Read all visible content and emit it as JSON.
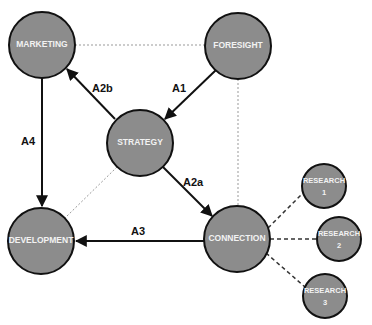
{
  "diagram": {
    "nodes": {
      "marketing": {
        "label": "MARKETING",
        "cx": 42,
        "cy": 45,
        "r": 33
      },
      "foresight": {
        "label": "FORESIGHT",
        "cx": 238,
        "cy": 46,
        "r": 33
      },
      "strategy": {
        "label": "STRATEGY",
        "cx": 140,
        "cy": 143,
        "r": 33
      },
      "development": {
        "label": "DEVELOPMENT",
        "cx": 41,
        "cy": 241,
        "r": 33
      },
      "connection": {
        "label": "CONNECTION",
        "cx": 237,
        "cy": 239,
        "r": 33
      },
      "research1": {
        "label_line1": "RESEARCH",
        "label_line2": "1",
        "cx": 324,
        "cy": 186,
        "r": 22
      },
      "research2": {
        "label_line1": "RESEARCH",
        "label_line2": "2",
        "cx": 339,
        "cy": 239,
        "r": 22
      },
      "research3": {
        "label_line1": "RESEARCH",
        "label_line2": "3",
        "cx": 325,
        "cy": 296,
        "r": 22
      }
    },
    "edges": {
      "a1": {
        "label": "A1",
        "from": "foresight",
        "to": "strategy",
        "style": "solid-arrow"
      },
      "a2a": {
        "label": "A2a",
        "from": "strategy",
        "to": "connection",
        "style": "solid-arrow"
      },
      "a2b": {
        "label": "A2b",
        "from": "strategy",
        "to": "marketing",
        "style": "solid-arrow"
      },
      "a3": {
        "label": "A3",
        "from": "connection",
        "to": "development",
        "style": "solid-arrow"
      },
      "a4": {
        "label": "A4",
        "from": "marketing",
        "to": "development",
        "style": "solid-arrow"
      }
    },
    "colors": {
      "node_fill": "#8c8c8c",
      "node_stroke": "#111111",
      "label_text": "#f2f2f2",
      "edge": "#111111",
      "dotted_line": "#999999"
    }
  }
}
